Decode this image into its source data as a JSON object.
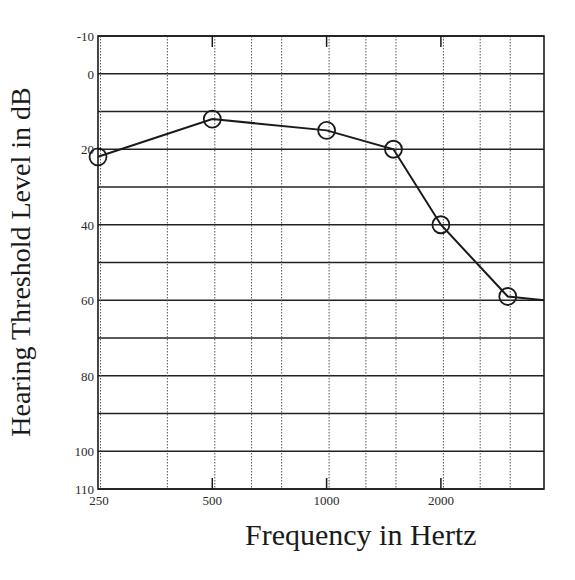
{
  "chart_data": {
    "type": "line",
    "title": "",
    "xlabel": "Frequency in Hertz",
    "ylabel": "Hearing Threshold Level in dB",
    "x_scale": "log",
    "x_range_hz": [
      250,
      3740
    ],
    "ylim": [
      -10,
      110
    ],
    "y_inverted": true,
    "x_tick_labels": [
      "250",
      "500",
      "1000",
      "2000"
    ],
    "x_tick_values": [
      250,
      500,
      1000,
      2000
    ],
    "x_minor_gridlines_hz": [
      250,
      375,
      500,
      625,
      750,
      1000,
      1250,
      1500,
      2000,
      2500,
      3000
    ],
    "y_tick_labels": [
      "-10",
      "0",
      "20",
      "40",
      "60",
      "80",
      "100",
      "110"
    ],
    "y_tick_values": [
      -10,
      0,
      20,
      40,
      60,
      80,
      100,
      110
    ],
    "y_gridlines": [
      -10,
      0,
      10,
      20,
      30,
      40,
      50,
      60,
      70,
      80,
      90,
      100,
      110
    ],
    "grid": true,
    "legend": null,
    "series": [
      {
        "name": "Hearing threshold",
        "marker": "circle",
        "x": [
          250,
          500,
          1000,
          1500,
          2000,
          3000
        ],
        "values": [
          22,
          12,
          15,
          20,
          40,
          59
        ],
        "line_extends_to": {
          "x": 3740,
          "y": 60
        }
      }
    ]
  },
  "colors": {
    "ink": "#1a1a1a",
    "grid": "#222222",
    "dotted_grid": "#555555",
    "background": "#ffffff"
  }
}
